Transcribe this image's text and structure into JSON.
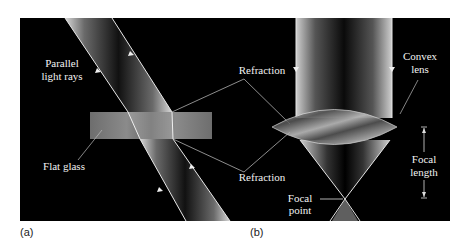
{
  "figure": {
    "panels": [
      {
        "id": "a",
        "label": "(a)",
        "annotations": {
          "parallel_light_rays_line1": "Parallel",
          "parallel_light_rays_line2": "light rays",
          "flat_glass": "Flat glass"
        }
      },
      {
        "id": "b",
        "label": "(b)",
        "annotations": {
          "convex_lens_line1": "Convex",
          "convex_lens_line2": "lens",
          "focal_length_line1": "Focal",
          "focal_length_line2": "length",
          "focal_point_line1": "Focal",
          "focal_point_line2": "point"
        }
      }
    ],
    "shared_annotations": {
      "refraction_top": "Refraction",
      "refraction_bottom": "Refraction"
    },
    "colors": {
      "background": "#000000",
      "beam_edge": "#e8e8e8",
      "glass": "#8a8a8a",
      "label": "#f2f2f2",
      "page": "#ffffff"
    }
  }
}
